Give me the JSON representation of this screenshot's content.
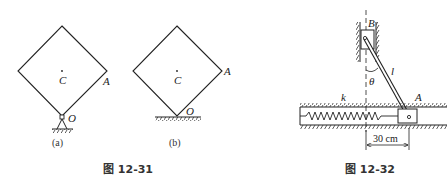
{
  "figure_12_31": {
    "caption": "图 12-31",
    "sub_a": {
      "caption": "(a)",
      "labels": {
        "center": "C",
        "corner": "A",
        "pivot": "O"
      },
      "support": "pin-support"
    },
    "sub_b": {
      "caption": "(b)",
      "labels": {
        "center": "C",
        "corner": "A",
        "contact": "O"
      },
      "support": "smooth-floor"
    }
  },
  "figure_12_32": {
    "caption": "图 12-32",
    "labels": {
      "slider_top": "B",
      "rod": "l",
      "angle": "θ",
      "spring": "k",
      "slider_bottom": "A"
    },
    "dimension": "30 cm"
  },
  "colors": {
    "stroke": "#222222",
    "background": "#ffffff"
  }
}
